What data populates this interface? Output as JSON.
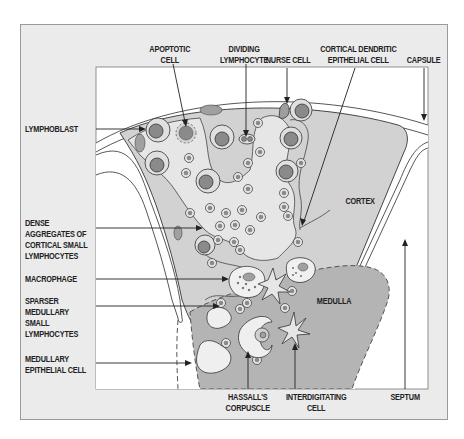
{
  "diagram": {
    "regions": {
      "cortex": "CORTEX",
      "medulla": "MEDULLA"
    },
    "labels": {
      "top": [
        {
          "id": "apoptotic_cell",
          "text": "APOPTOTIC\nCELL"
        },
        {
          "id": "dividing_lymphocyte",
          "text": "DIVIDING\nLYMPHOCYTE"
        },
        {
          "id": "nurse_cell",
          "text": "NURSE CELL"
        },
        {
          "id": "cortical_dendritic_epithelial_cell",
          "text": "CORTICAL DENDRITIC\nEPITHELIAL CELL"
        },
        {
          "id": "capsule",
          "text": "CAPSULE"
        }
      ],
      "left": [
        {
          "id": "lymphoblast",
          "text": "LYMPHOBLAST"
        },
        {
          "id": "dense_aggregates",
          "text": "DENSE\nAGGREGATES OF\nCORTICAL SMALL\nLYMPHOCYTES"
        },
        {
          "id": "macrophage",
          "text": "MACROPHAGE"
        },
        {
          "id": "sparser_medullary",
          "text": "SPARSER\nMEDULLARY\nSMALL\nLYMPHOCYTES"
        },
        {
          "id": "medullary_epithelial_cell",
          "text": "MEDULLARY\nEPITHELIAL CELL"
        }
      ],
      "bottom": [
        {
          "id": "hassalls_corpuscle",
          "text": "HASSALL'S\nCORPUSCLE"
        },
        {
          "id": "interdigitating_cell",
          "text": "INTERDIGITATING\nCELL"
        },
        {
          "id": "septum",
          "text": "SEPTUM"
        }
      ]
    },
    "colors": {
      "frame_bg": "#ebebeb",
      "capsule": "#ffffff",
      "cortex": "#d2d2d2",
      "medulla": "#b4b4b4",
      "nucleus": "#8a8a8a",
      "outline": "#333333"
    }
  }
}
